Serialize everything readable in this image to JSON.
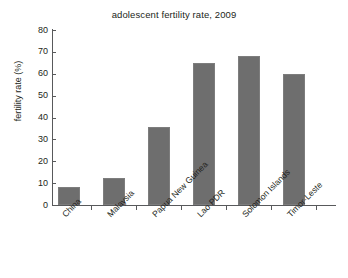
{
  "chart_data": {
    "type": "bar",
    "title": "adolescent fertility rate, 2009",
    "xlabel": "",
    "ylabel": "fertility rate (%)",
    "categories": [
      "China",
      "Malaysia",
      "Papua New Guinea",
      "Lao PDR",
      "Solomon Islands",
      "Timor-Leste"
    ],
    "values": [
      8.3,
      12.5,
      35.5,
      65,
      68,
      60
    ],
    "ylim": [
      0,
      80
    ],
    "yticks": [
      0,
      10,
      20,
      30,
      40,
      50,
      60,
      70,
      80
    ],
    "ytick_labels": [
      "0",
      "10",
      "20",
      "30",
      "40",
      "50",
      "60",
      "70",
      "80"
    ],
    "grid": false,
    "legend": false,
    "bar_color": "#6e6e6e",
    "axis_color": "#58595b",
    "background": "#ffffff"
  }
}
